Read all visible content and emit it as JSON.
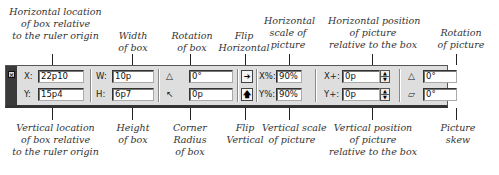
{
  "callouts_top": [
    {
      "id": "horizontal-location",
      "lines": [
        "Horizontal location",
        "of box relative",
        "to the ruler origin"
      ]
    },
    {
      "id": "width",
      "lines": [
        "Width",
        "of box"
      ]
    },
    {
      "id": "rotation-box",
      "lines": [
        "Rotation",
        "of box"
      ]
    },
    {
      "id": "flip-horizontal",
      "lines": [
        "Flip",
        "Horizontal"
      ]
    },
    {
      "id": "horizontal-scale",
      "lines": [
        "Horizontal",
        "scale of",
        "picture"
      ]
    },
    {
      "id": "horizontal-position",
      "lines": [
        "Horizontal position",
        "of picture",
        "relative to the box"
      ]
    },
    {
      "id": "rotation-picture",
      "lines": [
        "Rotation",
        "of picture"
      ]
    }
  ],
  "callouts_bottom": [
    {
      "id": "vertical-location",
      "lines": [
        "Vertical location",
        "of box relative",
        "to the ruler origin"
      ]
    },
    {
      "id": "height",
      "lines": [
        "Height",
        "of box"
      ]
    },
    {
      "id": "corner-radius",
      "lines": [
        "Corner",
        "Radius",
        "of box"
      ]
    },
    {
      "id": "flip-vertical",
      "lines": [
        "Flip",
        "Vertical"
      ]
    },
    {
      "id": "vertical-scale",
      "lines": [
        "Vertical scale",
        "of picture"
      ]
    },
    {
      "id": "vertical-position",
      "lines": [
        "Vertical position",
        "of picture",
        "relative to the box"
      ]
    },
    {
      "id": "picture-skew",
      "lines": [
        "Picture",
        "skew"
      ]
    }
  ],
  "toolbar": {
    "close_glyph": "×",
    "x_label": "X:",
    "x_value": "22p10",
    "y_label": "Y:",
    "y_value": "15p4",
    "w_label": "W:",
    "w_value": "10p",
    "h_label": "H:",
    "h_value": "6p7",
    "box_rotation_icon": "△",
    "box_rotation_value": "0°",
    "corner_radius_icon": "↖",
    "corner_radius_value": "0p",
    "flip_horizontal_glyph": "➔",
    "flip_vertical_glyph": "🡅",
    "scale_x_label": "X%:",
    "scale_x_value": "90%",
    "scale_y_label": "Y%:",
    "scale_y_value": "90%",
    "offset_x_label": "X+:",
    "offset_x_value": "0p",
    "offset_y_label": "Y+:",
    "offset_y_value": "0p",
    "stepper_up": "▲",
    "stepper_down": "▼",
    "picture_rotation_icon": "△",
    "picture_rotation_value": "0°",
    "picture_skew_icon": "▱",
    "picture_skew_value": "0°"
  }
}
